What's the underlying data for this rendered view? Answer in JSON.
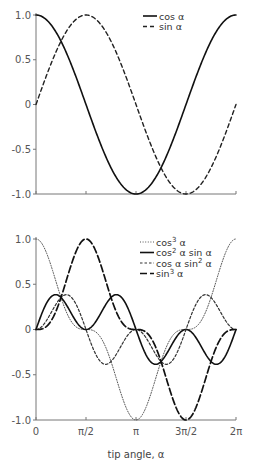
{
  "chart_data": [
    {
      "type": "line",
      "title": "",
      "xlabel": "",
      "ylabel": "",
      "xlim": [
        0,
        6.2832
      ],
      "ylim": [
        -1.0,
        1.0
      ],
      "grid": false,
      "legend_position": "top-right",
      "yticks": [
        1.0,
        0.5,
        0,
        -0.5,
        -1.0
      ],
      "ytick_labels": [
        "1.0",
        "0.5",
        "0",
        "-0.5",
        "-1.0"
      ],
      "xticks": [
        0,
        1.5708,
        3.1416,
        4.7124,
        6.2832
      ],
      "xtick_labels": [
        "",
        "",
        "",
        "",
        ""
      ],
      "series": [
        {
          "name": "cos α",
          "label_main": "cos",
          "label_sup": "",
          "label_tail": " α",
          "style": "solid",
          "function": "cos(a)",
          "x": [
            0,
            0.7854,
            1.5708,
            2.3562,
            3.1416,
            3.927,
            4.7124,
            5.4978,
            6.2832
          ],
          "values": [
            1.0,
            0.707,
            0.0,
            -0.707,
            -1.0,
            -0.707,
            0.0,
            0.707,
            1.0
          ]
        },
        {
          "name": "sin α",
          "label_main": "sin",
          "label_sup": "",
          "label_tail": " α",
          "style": "dashed",
          "function": "sin(a)",
          "x": [
            0,
            0.7854,
            1.5708,
            2.3562,
            3.1416,
            3.927,
            4.7124,
            5.4978,
            6.2832
          ],
          "values": [
            0.0,
            0.707,
            1.0,
            0.707,
            0.0,
            -0.707,
            -1.0,
            -0.707,
            0.0
          ]
        }
      ]
    },
    {
      "type": "line",
      "title": "",
      "xlabel": "tip angle, α",
      "ylabel": "",
      "xlim": [
        0,
        6.2832
      ],
      "ylim": [
        -1.0,
        1.0
      ],
      "grid": false,
      "legend_position": "top-right",
      "yticks": [
        1.0,
        0.5,
        0,
        -0.5,
        -1.0
      ],
      "ytick_labels": [
        "1.0",
        "0.5",
        "0",
        "-0.5",
        "-1.0"
      ],
      "xticks": [
        0,
        1.5708,
        3.1416,
        4.7124,
        6.2832
      ],
      "xtick_labels": [
        "0",
        "π/2",
        "π",
        "3π/2",
        "2π"
      ],
      "series": [
        {
          "name": "cos³ α",
          "label_main": "cos",
          "label_sup": "3",
          "label_tail": " α",
          "style": "dotted",
          "function": "cos3",
          "x": [
            0,
            0.7854,
            1.5708,
            2.3562,
            3.1416,
            3.927,
            4.7124,
            5.4978,
            6.2832
          ],
          "values": [
            1.0,
            0.354,
            0.0,
            -0.354,
            -1.0,
            -0.354,
            0.0,
            0.354,
            1.0
          ]
        },
        {
          "name": "cos² α sin α",
          "label_main": "cos",
          "label_sup": "2",
          "label_tail": " α sin α",
          "style": "solid",
          "function": "cos2sin",
          "x": [
            0,
            0.6155,
            1.5708,
            2.5261,
            3.1416,
            3.7571,
            4.7124,
            5.6677,
            6.2832
          ],
          "values": [
            0.0,
            0.385,
            0.0,
            0.385,
            0.0,
            -0.385,
            0.0,
            -0.385,
            0.0
          ]
        },
        {
          "name": "cos α sin² α",
          "label_main": "cos α sin",
          "label_sup": "2",
          "label_tail": " α",
          "style": "short-dash",
          "function": "cossin2",
          "x": [
            0,
            0.9553,
            1.5708,
            2.1863,
            3.1416,
            4.0969,
            4.7124,
            5.3279,
            6.2832
          ],
          "values": [
            0.0,
            0.385,
            0.0,
            -0.385,
            0.0,
            -0.385,
            0.0,
            0.385,
            0.0
          ]
        },
        {
          "name": "sin³ α",
          "label_main": "sin",
          "label_sup": "3",
          "label_tail": " α",
          "style": "long-dash",
          "function": "sin3",
          "x": [
            0,
            0.7854,
            1.5708,
            2.3562,
            3.1416,
            3.927,
            4.7124,
            5.4978,
            6.2832
          ],
          "values": [
            0.0,
            0.354,
            1.0,
            0.354,
            0.0,
            -0.354,
            -1.0,
            -0.354,
            0.0
          ]
        }
      ]
    }
  ]
}
